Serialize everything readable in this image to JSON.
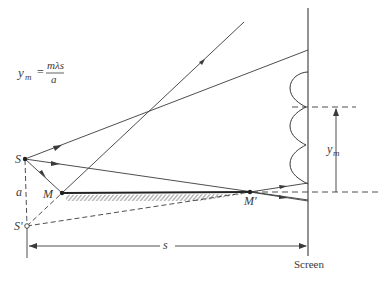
{
  "diagram": {
    "formula": {
      "lhs": "y",
      "lhs_sub": "m",
      "equals": "=",
      "numerator": "mλs",
      "denominator": "a"
    },
    "labels": {
      "source": "S",
      "image_source": "S′",
      "separation": "a",
      "mirror_start": "M",
      "mirror_end": "M′",
      "distance": "s",
      "fringe_position": "y",
      "fringe_position_sub": "m",
      "screen": "Screen"
    },
    "colors": {
      "line": "#3a3a3a",
      "background": "#ffffff"
    },
    "fringe_count": 3
  }
}
